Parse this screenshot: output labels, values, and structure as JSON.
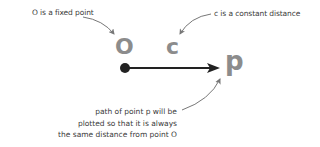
{
  "annotations": {
    "fixed_point": "O is a fixed point",
    "constant_distance": "c is a constant distance",
    "path_note": [
      "path of point p will be",
      "plotted so that it is always",
      "the same distance from point O"
    ]
  },
  "labels": {
    "origin": "O",
    "distance": "c",
    "point": "p"
  },
  "colors": {
    "label_grey": "#8c8c8c",
    "arrow_dark": "#222222",
    "annotation_arrow": "#777777",
    "text": "#3a3a3a"
  }
}
